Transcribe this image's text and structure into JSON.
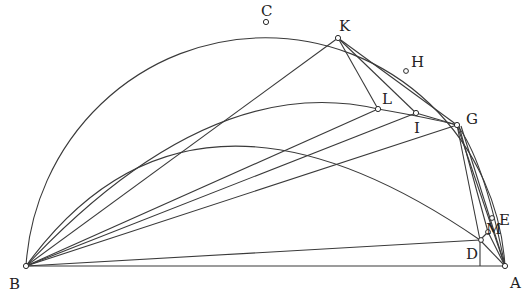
{
  "figure": {
    "type": "geometric-construction",
    "colors": {
      "stroke": "#3a3a3a",
      "label": "#222222",
      "background": "#ffffff"
    },
    "points": [
      {
        "id": "A",
        "label": "A",
        "x": 505,
        "y": 266,
        "lx": 510,
        "ly": 288
      },
      {
        "id": "B",
        "label": "B",
        "x": 26,
        "y": 266,
        "lx": 9,
        "ly": 289
      },
      {
        "id": "C",
        "label": "C",
        "x": 266,
        "y": 22,
        "lx": 261,
        "ly": 16
      },
      {
        "id": "D",
        "label": "D",
        "x": 480,
        "y": 240,
        "lx": 466,
        "ly": 259
      },
      {
        "id": "E",
        "label": "E",
        "x": 492,
        "y": 218,
        "lx": 499,
        "ly": 225
      },
      {
        "id": "G",
        "label": "G",
        "x": 457,
        "y": 125,
        "lx": 466,
        "ly": 124
      },
      {
        "id": "H",
        "label": "H",
        "x": 406,
        "y": 71,
        "lx": 411,
        "ly": 67
      },
      {
        "id": "I",
        "label": "I",
        "x": 416,
        "y": 113,
        "lx": 414,
        "ly": 133
      },
      {
        "id": "K",
        "label": "K",
        "x": 338,
        "y": 38,
        "lx": 339,
        "ly": 31
      },
      {
        "id": "L",
        "label": "L",
        "x": 378,
        "y": 109,
        "lx": 382,
        "ly": 104
      },
      {
        "id": "M",
        "label": "M",
        "x": 488,
        "y": 232,
        "lx": 486,
        "ly": 234
      }
    ],
    "labels": [
      "A",
      "B",
      "C",
      "D",
      "E",
      "G",
      "H",
      "I",
      "K",
      "L",
      "M"
    ]
  }
}
